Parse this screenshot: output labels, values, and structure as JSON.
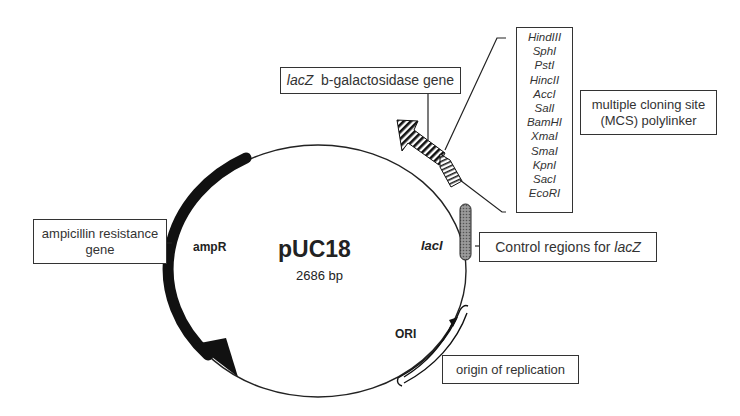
{
  "plasmid": {
    "name": "pUC18",
    "size": "2686 bp"
  },
  "features": {
    "ampR": {
      "label": "ampR",
      "annotation": "ampicillin resistance gene",
      "annotation_line1": "ampicillin resistance",
      "annotation_line2": "gene"
    },
    "lacZ": {
      "gene": "lacZ",
      "annotation_suffix": "b-galactosidase gene"
    },
    "lacI": {
      "label": "lacI",
      "annotation_prefix": "Control regions for ",
      "annotation_gene": "lacZ"
    },
    "ori": {
      "label": "ORI",
      "annotation": "origin of replication"
    },
    "mcs": {
      "annotation_line1": "multiple cloning site",
      "annotation_line2": "(MCS) polylinker"
    }
  },
  "restriction_sites": [
    "HindIII",
    "SphI",
    "PstI",
    "HincII",
    "AccI",
    "SalI",
    "BamHI",
    "XmaI",
    "SmaI",
    "KpnI",
    "SacI",
    "EcoRI"
  ],
  "colors": {
    "ampR_arrow": "#111111",
    "backbone": "#222222",
    "box_border": "#333333"
  }
}
